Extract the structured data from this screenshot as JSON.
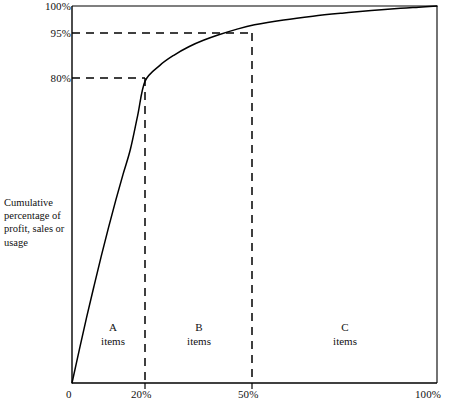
{
  "chart_data": {
    "type": "line",
    "title": "",
    "subtitle": "",
    "xlabel": "",
    "ylabel": "Cumulative percentage of profit, sales or usage",
    "xlim": [
      0,
      100
    ],
    "ylim": [
      0,
      100
    ],
    "grid": false,
    "legend": null,
    "x_ticks": [
      {
        "value": 0,
        "label": "0"
      },
      {
        "value": 20,
        "label": "20%"
      },
      {
        "value": 50,
        "label": "50%"
      },
      {
        "value": 100,
        "label": "100%"
      }
    ],
    "y_ticks": [
      {
        "value": 80,
        "label": "80%"
      },
      {
        "value": 95,
        "label": "95%"
      },
      {
        "value": 100,
        "label": "100%"
      }
    ],
    "series": [
      {
        "name": "Cumulative Pareto curve",
        "x": [
          0,
          2,
          4,
          6,
          8,
          10,
          12,
          14,
          16,
          18,
          20,
          24,
          28,
          32,
          36,
          40,
          45,
          50,
          58,
          66,
          74,
          82,
          90,
          95,
          100
        ],
        "y": [
          0,
          8.8,
          17.4,
          25.6,
          33.6,
          41.2,
          48.5,
          55.4,
          62.0,
          71.0,
          80.0,
          84.2,
          87.0,
          89.2,
          90.9,
          92.3,
          93.8,
          95.0,
          96.3,
          97.3,
          98.1,
          98.8,
          99.4,
          99.7,
          100.0
        ]
      }
    ],
    "annotations": {
      "guides": [
        {
          "name": "guide-80-percent",
          "type": "horizontal-dashed",
          "y": 80,
          "x_from": 0,
          "x_to": 20
        },
        {
          "name": "guide-95-percent",
          "type": "horizontal-dashed",
          "y": 95,
          "x_from": 0,
          "x_to": 50
        },
        {
          "name": "guide-20-percent",
          "type": "vertical-dashed",
          "x": 20,
          "y_from": 0,
          "y_to": 80
        },
        {
          "name": "guide-50-percent",
          "type": "vertical-dashed",
          "x": 50,
          "y_from": 0,
          "y_to": 95
        }
      ],
      "zones": [
        {
          "id": "A",
          "letter": "A",
          "items": "items",
          "x_from": 0,
          "x_to": 20
        },
        {
          "id": "B",
          "letter": "B",
          "items": "items",
          "x_from": 20,
          "x_to": 50
        },
        {
          "id": "C",
          "letter": "C",
          "items": "items",
          "x_from": 50,
          "x_to": 100
        }
      ]
    },
    "colors": {
      "curve": "#000000",
      "axis": "#000000",
      "guide": "#000000",
      "background": "#ffffff",
      "text": "#111111"
    }
  },
  "axis": {
    "y_label_text": "Cumulative percentage of profit, sales or usage",
    "y_tick_100": "100%",
    "y_tick_95": "95%",
    "y_tick_80": "80%",
    "x_tick_0": "0",
    "x_tick_20": "20%",
    "x_tick_50": "50%",
    "x_tick_100": "100%"
  },
  "zones": {
    "a_letter": "A",
    "a_items": "items",
    "b_letter": "B",
    "b_items": "items",
    "c_letter": "C",
    "c_items": "items"
  }
}
